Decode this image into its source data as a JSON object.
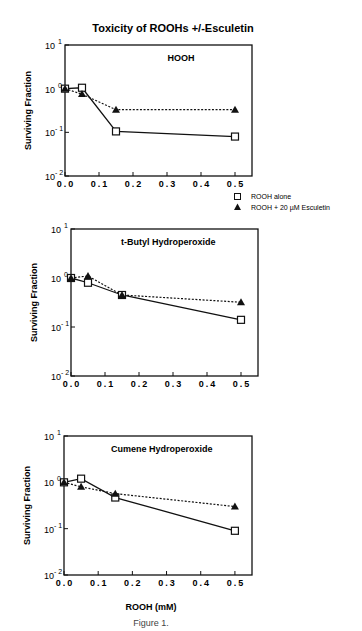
{
  "figure": {
    "title": "Toxicity of ROOHs  +/-Esculetin",
    "xlabel": "ROOH (mM)",
    "caption": "Figure 1.",
    "ylabel": "Surviving   Fraction"
  },
  "legend": {
    "items": [
      {
        "marker": "open-square",
        "label": "ROOH alone"
      },
      {
        "marker": "filled-triangle",
        "label": "ROOH +  20 µM Esculetin"
      }
    ]
  },
  "colors": {
    "line": "#111111",
    "background": "#ffffff"
  },
  "chart_data": [
    {
      "type": "line",
      "title": "HOOH",
      "xlabel": "ROOH (mM)",
      "ylabel": "Surviving Fraction",
      "yscale": "log",
      "ylim": [
        0.01,
        10
      ],
      "xlim": [
        0,
        0.55
      ],
      "xticks": [
        "0.0",
        "0.1",
        "0.2",
        "0.3",
        "0.4",
        "0.5"
      ],
      "yticks": [
        "10^1",
        "10^0",
        "10^-1",
        "10^-2"
      ],
      "x": [
        0,
        0.05,
        0.15,
        0.5
      ],
      "series": [
        {
          "name": "ROOH alone",
          "marker": "open-square",
          "line": "solid",
          "values": [
            1.0,
            1.05,
            0.105,
            0.08
          ]
        },
        {
          "name": "ROOH + 20 µM Esculetin",
          "marker": "filled-triangle",
          "line": "dotted",
          "values": [
            1.0,
            0.75,
            0.33,
            0.33
          ]
        }
      ],
      "frame": {
        "left": 65,
        "right": 252,
        "top": 45,
        "bottom": 176
      }
    },
    {
      "type": "line",
      "title": "t-Butyl Hydroperoxide",
      "xlabel": "",
      "ylabel": "Surviving Fraction",
      "yscale": "log",
      "ylim": [
        0.01,
        10
      ],
      "xlim": [
        0,
        0.55
      ],
      "xticks": [
        "0.0",
        "0.1",
        "0.2",
        "0.3",
        "0.4",
        "0.5"
      ],
      "yticks": [
        "10^1",
        "10^0",
        "10^-1",
        "10^-2"
      ],
      "x": [
        0,
        0.05,
        0.15,
        0.5
      ],
      "series": [
        {
          "name": "ROOH alone",
          "marker": "open-square",
          "line": "solid",
          "values": [
            1.0,
            0.8,
            0.45,
            0.14
          ]
        },
        {
          "name": "ROOH + 20 µM Esculetin",
          "marker": "filled-triangle",
          "line": "dotted",
          "values": [
            1.0,
            1.1,
            0.45,
            0.32
          ]
        }
      ],
      "frame": {
        "left": 71,
        "right": 258,
        "top": 229,
        "bottom": 376
      }
    },
    {
      "type": "line",
      "title": "Cumene Hydroperoxide",
      "xlabel": "ROOH (mM)",
      "ylabel": "Surviving Fraction",
      "yscale": "log",
      "ylim": [
        0.01,
        10
      ],
      "xlim": [
        0,
        0.55
      ],
      "xticks": [
        "0.0",
        "0.1",
        "0.2",
        "0.3",
        "0.4",
        "0.5"
      ],
      "yticks": [
        "10^1",
        "10^0",
        "10^-1",
        "10^-2"
      ],
      "x": [
        0,
        0.05,
        0.15,
        0.5
      ],
      "series": [
        {
          "name": "ROOH alone",
          "marker": "open-square",
          "line": "solid",
          "values": [
            1.0,
            1.2,
            0.47,
            0.09
          ]
        },
        {
          "name": "ROOH + 20 µM Esculetin",
          "marker": "filled-triangle",
          "line": "dotted",
          "values": [
            1.0,
            0.8,
            0.57,
            0.3
          ]
        }
      ],
      "frame": {
        "left": 64,
        "right": 252,
        "top": 436,
        "bottom": 575
      }
    }
  ]
}
